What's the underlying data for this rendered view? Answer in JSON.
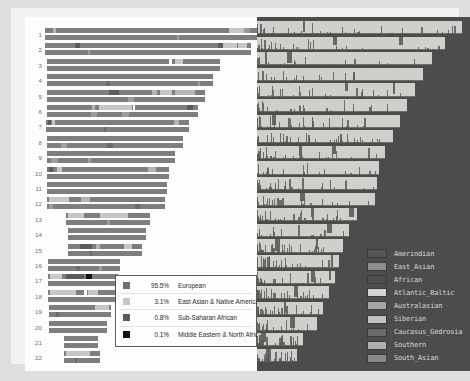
{
  "figure": {
    "panels": [
      "karyogram",
      "ancestry-composition"
    ]
  },
  "chart_data": {
    "type": "bar",
    "xlabel": "",
    "ylabel": "Chromosome",
    "categories": [
      "1",
      "2",
      "3",
      "4",
      "5",
      "6",
      "7",
      "8",
      "9",
      "10",
      "11",
      "12",
      "13",
      "14",
      "15",
      "16",
      "17",
      "18",
      "19",
      "20",
      "21",
      "22"
    ],
    "series": [
      {
        "name": "European",
        "value": 95.5
      },
      {
        "name": "East Asian & Native American",
        "value": 3.1
      },
      {
        "name": "Sub-Saharan African",
        "value": 0.8
      },
      {
        "name": "Middle Eastern & North African",
        "value": 0.1
      }
    ],
    "legend_position": "bottom-center"
  },
  "left_panel": {
    "name": "karyogram",
    "rows": [
      {
        "label": "1",
        "indent": 0,
        "w": 212,
        "segs": [
          [
            8,
            3,
            "c"
          ],
          [
            184,
            16,
            "b"
          ],
          [
            199,
            6,
            "a"
          ]
        ]
      },
      {
        "label": "2",
        "indent": 0,
        "w": 206,
        "segs": [
          [
            30,
            5,
            "d"
          ],
          [
            173,
            5,
            "d"
          ],
          [
            178,
            14,
            "b"
          ],
          [
            193,
            9,
            "b"
          ]
        ]
      },
      {
        "label": "3",
        "indent": 2,
        "w": 173,
        "segs": [
          [
            122,
            3,
            "w"
          ],
          [
            128,
            8,
            "b"
          ]
        ]
      },
      {
        "label": "4",
        "indent": 2,
        "w": 166,
        "segs": []
      },
      {
        "label": "5",
        "indent": 2,
        "w": 158,
        "segs": [
          [
            62,
            10,
            "d"
          ],
          [
            105,
            5,
            "c"
          ],
          [
            113,
            12,
            "b"
          ],
          [
            128,
            20,
            "c"
          ]
        ]
      },
      {
        "label": "6",
        "indent": 2,
        "w": 151,
        "segs": [
          [
            45,
            3,
            "c"
          ],
          [
            52,
            33,
            "b"
          ],
          [
            86,
            2,
            "w"
          ],
          [
            140,
            6,
            "d"
          ]
        ]
      },
      {
        "label": "7",
        "indent": 1,
        "w": 143,
        "segs": [
          [
            2,
            3,
            "d"
          ],
          [
            6,
            3,
            "b"
          ],
          [
            128,
            5,
            "c"
          ]
        ]
      },
      {
        "label": "8",
        "indent": 2,
        "w": 136,
        "segs": []
      },
      {
        "label": "9",
        "indent": 2,
        "w": 128,
        "segs": []
      },
      {
        "label": "10",
        "indent": 2,
        "w": 122,
        "segs": [
          [
            2,
            4,
            "d"
          ],
          [
            10,
            5,
            "b"
          ],
          [
            101,
            8,
            "c"
          ]
        ]
      },
      {
        "label": "11",
        "indent": 2,
        "w": 120,
        "segs": []
      },
      {
        "label": "12",
        "indent": 2,
        "w": 118,
        "segs": [
          [
            2,
            20,
            "b"
          ],
          [
            34,
            9,
            "c"
          ]
        ]
      },
      {
        "label": "13",
        "indent": 21,
        "w": 84,
        "segs": [
          [
            2,
            16,
            "b"
          ],
          [
            34,
            28,
            "b"
          ]
        ]
      },
      {
        "label": "14",
        "indent": 23,
        "w": 78,
        "segs": []
      },
      {
        "label": "15",
        "indent": 23,
        "w": 74,
        "segs": [
          [
            12,
            12,
            "d"
          ],
          [
            28,
            4,
            "c"
          ],
          [
            56,
            8,
            "b"
          ]
        ]
      },
      {
        "label": "16",
        "indent": 3,
        "w": 72,
        "segs": []
      },
      {
        "label": "17",
        "indent": 3,
        "w": 70,
        "segs": [
          [
            2,
            12,
            "b"
          ],
          [
            18,
            18,
            "d"
          ],
          [
            38,
            6,
            "k"
          ]
        ]
      },
      {
        "label": "18",
        "indent": 3,
        "w": 68,
        "segs": [
          [
            2,
            26,
            "b"
          ],
          [
            36,
            3,
            "w"
          ],
          [
            40,
            10,
            "b"
          ]
        ]
      },
      {
        "label": "19",
        "indent": 4,
        "w": 62,
        "segs": [
          [
            46,
            14,
            "b"
          ]
        ]
      },
      {
        "label": "20",
        "indent": 4,
        "w": 58,
        "segs": []
      },
      {
        "label": "21",
        "indent": 19,
        "w": 34,
        "segs": []
      },
      {
        "label": "22",
        "indent": 19,
        "w": 36,
        "segs": [
          [
            2,
            24,
            "b"
          ]
        ]
      }
    ],
    "legend": {
      "name": "ancestry-legend",
      "items": [
        {
          "pct": "95.5%",
          "label": "European",
          "color": "#6e6e6e"
        },
        {
          "pct": "3.1%",
          "label": "East Asian & Native American",
          "color": "#c6c6c6"
        },
        {
          "pct": "0.8%",
          "label": "Sub-Saharan African",
          "color": "#5a5a5a"
        },
        {
          "pct": "0.1%",
          "label": "Middle Eastern & North African",
          "color": "#111111"
        }
      ]
    }
  },
  "right_panel": {
    "name": "ancestry-composition",
    "background": "#4c4c4c",
    "bar_color": "#cfcfcb",
    "rows_widths": [
      205,
      188,
      175,
      166,
      158,
      150,
      143,
      136,
      128,
      122,
      120,
      118,
      100,
      92,
      86,
      82,
      78,
      72,
      66,
      60,
      46,
      40
    ],
    "legend": {
      "name": "population-legend",
      "items": [
        {
          "label": "Amerindian",
          "color": "#565656"
        },
        {
          "label": "East_Asian",
          "color": "#8e8e8e"
        },
        {
          "label": "African",
          "color": "#4e4e4e"
        },
        {
          "label": "Atlantic_Baltic",
          "color": "#d4d4d4"
        },
        {
          "label": "Australasian",
          "color": "#a6a6a6"
        },
        {
          "label": "Siberian",
          "color": "#c2c2c2"
        },
        {
          "label": "Caucasus_Gedrosia",
          "color": "#6a6a6a"
        },
        {
          "label": "Southern",
          "color": "#b0b0b0"
        },
        {
          "label": "South_Asian",
          "color": "#8a8a8a"
        }
      ]
    }
  }
}
